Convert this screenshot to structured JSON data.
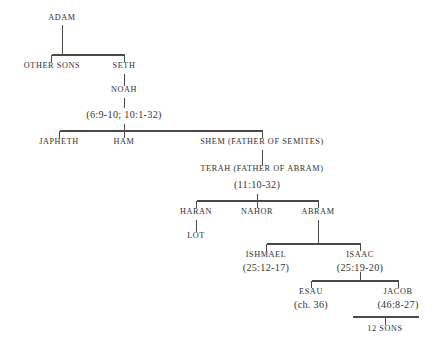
{
  "diagram": {
    "line_color": "#4a4a4a",
    "text_color": "#2e2e2e",
    "background": "#ffffff"
  },
  "nodes": {
    "adam": {
      "name": "ADAM"
    },
    "other_sons": {
      "name": "OTHER SONS"
    },
    "seth": {
      "name": "SETH"
    },
    "noah": {
      "name": "NOAH"
    },
    "noah_ref": {
      "ref": "(6:9-10;   10:1-32)"
    },
    "japheth": {
      "name": "JAPHETH"
    },
    "ham": {
      "name": "HAM"
    },
    "shem": {
      "name": "SHEM (FATHER OF SEMITES)"
    },
    "terah": {
      "name": "TERAH (FATHER OF ABRAM)",
      "ref": "(11:10-32)"
    },
    "haran": {
      "name": "HARAN"
    },
    "lot": {
      "name": "LOT"
    },
    "nahor": {
      "name": "NAHOR"
    },
    "abram": {
      "name": "ABRAM"
    },
    "ishmael": {
      "name": "ISHMAEL",
      "ref": "(25:12-17)"
    },
    "isaac": {
      "name": "ISAAC",
      "ref": "(25:19-20)"
    },
    "esau": {
      "name": "ESAU",
      "ref": "(ch. 36)"
    },
    "jacob": {
      "name": "JACOB",
      "ref": "(46:8-27)"
    },
    "twelve_sons": {
      "name": "12 SONS"
    }
  }
}
